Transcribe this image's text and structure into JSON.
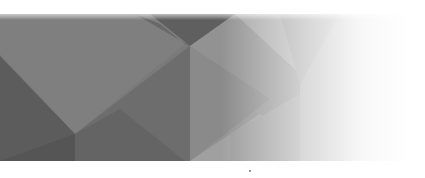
{
  "image": {
    "description": "Decorative banner of gray low-poly geometric facets fading to white on the right",
    "colors": {
      "dark": "#5e5e5e",
      "mid_dark": "#6e6e6e",
      "mid": "#7c7c7c",
      "light": "#8f8f8f",
      "lighter": "#a4a4a4",
      "background": "#ffffff"
    }
  }
}
